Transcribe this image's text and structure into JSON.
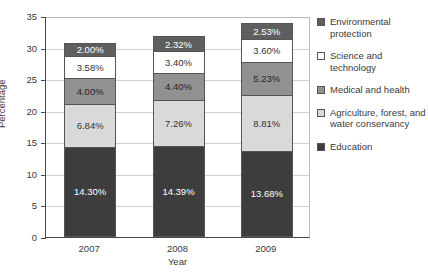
{
  "chart_data": {
    "type": "bar",
    "subtype": "stacked-bar",
    "title": "",
    "xlabel": "Year",
    "ylabel": "Percentage",
    "categories": [
      "2007",
      "2008",
      "2009"
    ],
    "ylim": [
      0,
      35
    ],
    "yticks": [
      0,
      5,
      10,
      15,
      20,
      25,
      30,
      35
    ],
    "ytick_labels": [
      "0",
      "5",
      "10",
      "15",
      "20",
      "25",
      "30",
      "35"
    ],
    "grid": true,
    "grid_axis": "y",
    "legend_position": "right",
    "stack_order": "bottom-to-top",
    "series": [
      {
        "name": "Education",
        "color": "#3d3d3d",
        "text_color": "#ffffff",
        "values": [
          14.3,
          14.39,
          13.68
        ],
        "labels": [
          "14.30%",
          "14.39%",
          "13.68%"
        ]
      },
      {
        "name": "Agriculture, forest, and water conservancy",
        "color": "#d9d9d9",
        "text_color": "#333333",
        "values": [
          6.84,
          7.26,
          8.81
        ],
        "labels": [
          "6.84%",
          "7.26%",
          "8.81%"
        ]
      },
      {
        "name": "Medical and health",
        "color": "#919191",
        "text_color": "#262626",
        "values": [
          4.0,
          4.4,
          5.23
        ],
        "labels": [
          "4.00%",
          "4.40%",
          "5.23%"
        ]
      },
      {
        "name": "Science and technology",
        "color": "#ffffff",
        "text_color": "#333333",
        "values": [
          3.58,
          3.4,
          3.6
        ],
        "labels": [
          "3.58%",
          "3.40%",
          "3.60%"
        ]
      },
      {
        "name": "Environmental protection",
        "color": "#5f5f5f",
        "text_color": "#ffffff",
        "values": [
          2.0,
          2.32,
          2.53
        ],
        "labels": [
          "2.00%",
          "2.32%",
          "2.53%"
        ]
      }
    ],
    "totals": [
      30.72,
      31.77,
      33.85
    ],
    "legend_entries": [
      {
        "label": "Environmental protection",
        "color": "#5f5f5f"
      },
      {
        "label": "Science and technology",
        "color": "#ffffff"
      },
      {
        "label": "Medical and health",
        "color": "#919191"
      },
      {
        "label": "Agriculture, forest, and water conservancy",
        "color": "#d9d9d9"
      },
      {
        "label": "Education",
        "color": "#3d3d3d"
      }
    ]
  }
}
